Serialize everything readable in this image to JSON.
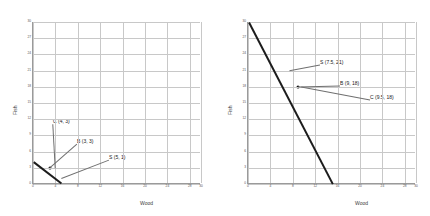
{
  "figure": {
    "panels": [
      {
        "id": "left",
        "axis": {
          "ylabel": "Fish",
          "xlabel": "Wood"
        },
        "xticks": [
          "0",
          "4",
          "8",
          "12",
          "16",
          "20",
          "24",
          "28",
          "30"
        ],
        "yticks": [
          "0",
          "3",
          "6",
          "9",
          "12",
          "15",
          "18",
          "21",
          "24",
          "27",
          "30"
        ],
        "annotations": [
          {
            "text": "C (4, 3)"
          },
          {
            "text": "B (3, 3)"
          },
          {
            "text": "S (5, 1)"
          }
        ]
      },
      {
        "id": "right",
        "axis": {
          "ylabel": "Fish",
          "xlabel": "Wood"
        },
        "xticks": [
          "0",
          "4",
          "8",
          "12",
          "16",
          "20",
          "24",
          "28",
          "30"
        ],
        "yticks": [
          "0",
          "3",
          "6",
          "9",
          "12",
          "15",
          "18",
          "21",
          "24",
          "27",
          "30"
        ],
        "annotations": [
          {
            "text": "S (7.5, 21)"
          },
          {
            "text": "B (9, 18)"
          },
          {
            "text": "C (9.5, 18)"
          }
        ]
      }
    ]
  },
  "chart_data": [
    {
      "type": "line",
      "panel": "left",
      "title": "",
      "xlabel": "Wood",
      "ylabel": "Fish",
      "xlim": [
        0,
        30
      ],
      "ylim": [
        0,
        30
      ],
      "grid": true,
      "legend": "none",
      "series": [
        {
          "name": "production possibility frontier",
          "style": "thick-black-line",
          "x": [
            0,
            5
          ],
          "y": [
            4,
            0
          ]
        }
      ],
      "points": [
        {
          "label": "C (4, 3)",
          "x": 4,
          "y": 3,
          "marker": false
        },
        {
          "label": "B (3, 3)",
          "x": 3,
          "y": 3,
          "marker": true
        },
        {
          "label": "S (5, 1)",
          "x": 5,
          "y": 1,
          "marker": false
        }
      ]
    },
    {
      "type": "line",
      "panel": "right",
      "title": "",
      "xlabel": "Wood",
      "ylabel": "Fish",
      "xlim": [
        0,
        30
      ],
      "ylim": [
        0,
        30
      ],
      "grid": true,
      "legend": "none",
      "series": [
        {
          "name": "production possibility frontier",
          "style": "thick-black-line",
          "x": [
            0,
            15
          ],
          "y": [
            30,
            0
          ]
        }
      ],
      "points": [
        {
          "label": "S (7.5, 21)",
          "x": 7.5,
          "y": 21,
          "marker": false
        },
        {
          "label": "B (9, 18)",
          "x": 9,
          "y": 18,
          "marker": true
        },
        {
          "label": "C (9.5, 18)",
          "x": 9.5,
          "y": 18,
          "marker": false
        }
      ]
    }
  ]
}
